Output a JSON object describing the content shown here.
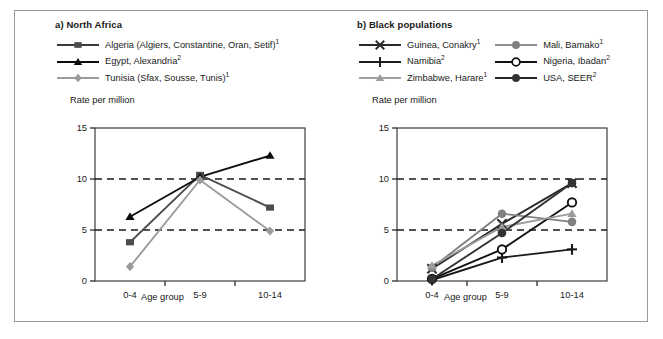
{
  "figure": {
    "background": "#ffffff",
    "border_color": "#9a9a9a"
  },
  "panel_a": {
    "title": "a) North Africa",
    "y_axis_title": "Rate per million",
    "x_axis_title": "Age group",
    "legend": [
      {
        "label": "Algeria (Algiers, Constantine, Oran, Setif)",
        "sup": "1",
        "marker": "square",
        "color": "#4d4d4d",
        "line_color": "#3a3a3a"
      },
      {
        "label": "Egypt, Alexandria",
        "sup": "2",
        "marker": "triangle",
        "color": "#0d0d0d",
        "line_color": "#0d0d0d"
      },
      {
        "label": "Tunisia (Sfax, Sousse, Tunis)",
        "sup": "1",
        "marker": "diamond",
        "color": "#9b9b9b",
        "line_color": "#9b9b9b"
      }
    ]
  },
  "panel_b": {
    "title": "b) Black populations",
    "y_axis_title": "Rate per million",
    "x_axis_title": "Age group",
    "legend": [
      {
        "label": "Guinea, Conakry",
        "sup": "1",
        "marker": "x",
        "color": "#2b2b2b",
        "line_color": "#2b2b2b"
      },
      {
        "label": "Mali, Bamako",
        "sup": "1",
        "marker": "circle-filled",
        "color": "#808080",
        "line_color": "#8f8f8f"
      },
      {
        "label": "Namibia",
        "sup": "2",
        "marker": "plus",
        "color": "#1a1a1a",
        "line_color": "#1a1a1a"
      },
      {
        "label": "Nigeria, Ibadan",
        "sup": "2",
        "marker": "circle-open",
        "color": "#111111",
        "line_color": "#111111"
      },
      {
        "label": "Zimbabwe, Harare",
        "sup": "1",
        "marker": "triangle",
        "color": "#9b9b9b",
        "line_color": "#a0a0a0"
      },
      {
        "label": "USA, SEER",
        "sup": "2",
        "marker": "circle-filled",
        "color": "#333333",
        "line_color": "#262626"
      }
    ]
  },
  "chart_data": [
    {
      "type": "line",
      "id": "chart-a",
      "title": "a) North Africa",
      "xlabel": "Age group",
      "ylabel": "Rate per million",
      "categories": [
        "0-4",
        "5-9",
        "10-14"
      ],
      "ylim": [
        0,
        15
      ],
      "yticks": [
        0,
        5,
        10,
        15
      ],
      "gridlines": [
        5,
        10
      ],
      "grid": "dashed-horizontal",
      "legend_position": "top",
      "series": [
        {
          "name": "Algeria (Algiers, Constantine, Oran, Setif)",
          "marker": "square",
          "color": "#4d4d4d",
          "values": [
            3.8,
            10.4,
            7.2
          ]
        },
        {
          "name": "Egypt, Alexandria",
          "marker": "triangle",
          "color": "#0d0d0d",
          "values": [
            6.3,
            10.2,
            12.3
          ]
        },
        {
          "name": "Tunisia (Sfax, Sousse, Tunis)",
          "marker": "diamond",
          "color": "#9b9b9b",
          "values": [
            1.4,
            9.9,
            4.9
          ]
        }
      ]
    },
    {
      "type": "line",
      "id": "chart-b",
      "title": "b) Black populations",
      "xlabel": "Age group",
      "ylabel": "Rate per million",
      "categories": [
        "0-4",
        "5-9",
        "10-14"
      ],
      "ylim": [
        0,
        15
      ],
      "yticks": [
        0,
        5,
        10,
        15
      ],
      "gridlines": [
        5,
        10
      ],
      "grid": "dashed-horizontal",
      "legend_position": "top",
      "series": [
        {
          "name": "Guinea, Conakry",
          "marker": "x",
          "color": "#2b2b2b",
          "values": [
            1.2,
            5.6,
            9.6
          ]
        },
        {
          "name": "Mali, Bamako",
          "marker": "circle-filled",
          "color": "#808080",
          "values": [
            1.3,
            6.6,
            5.8
          ]
        },
        {
          "name": "Namibia",
          "marker": "plus",
          "color": "#1a1a1a",
          "values": [
            0.1,
            2.3,
            3.1
          ]
        },
        {
          "name": "Nigeria, Ibadan",
          "marker": "circle-open",
          "color": "#111111",
          "values": [
            0.2,
            3.1,
            7.7
          ]
        },
        {
          "name": "Zimbabwe, Harare",
          "marker": "triangle",
          "color": "#9b9b9b",
          "values": [
            1.5,
            5.3,
            6.6
          ]
        },
        {
          "name": "USA, SEER",
          "marker": "circle-filled",
          "color": "#333333",
          "values": [
            0.2,
            4.7,
            9.6
          ]
        }
      ]
    }
  ]
}
